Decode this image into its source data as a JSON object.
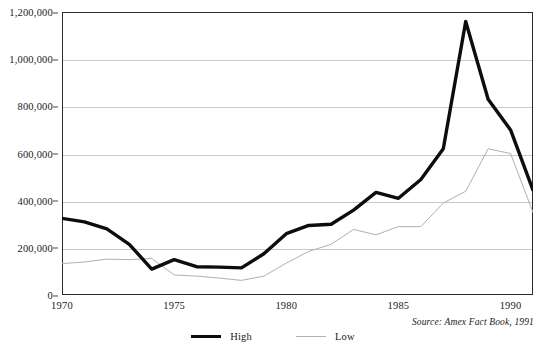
{
  "chart_data": {
    "type": "line",
    "title": "",
    "subtitle": "",
    "xlabel": "",
    "ylabel": "",
    "xlim": [
      1970,
      1991
    ],
    "ylim": [
      0,
      1200000
    ],
    "grid": true,
    "grid_axis": "y",
    "legend_position": "bottom-center",
    "source": "Source: Amex Fact Book, 1991",
    "x": [
      1970,
      1971,
      1972,
      1973,
      1974,
      1975,
      1976,
      1977,
      1978,
      1979,
      1980,
      1981,
      1982,
      1983,
      1984,
      1985,
      1986,
      1987,
      1988,
      1989,
      1990,
      1991
    ],
    "y_tick_labels": [
      "0",
      "200,000",
      "400,000",
      "600,000",
      "800,000",
      "1,000,000",
      "1,200,000"
    ],
    "y_tick_values": [
      0,
      200000,
      400000,
      600000,
      800000,
      1000000,
      1200000
    ],
    "x_tick_labels": [
      "1970",
      "1975",
      "1980",
      "1985",
      "1990"
    ],
    "x_tick_values": [
      1970,
      1975,
      1980,
      1985,
      1990
    ],
    "series": [
      {
        "name": "High",
        "color": "#0d0d0d",
        "width": 3.4,
        "values": [
          325000,
          310000,
          280000,
          215000,
          110000,
          150000,
          120000,
          118000,
          115000,
          175000,
          260000,
          295000,
          300000,
          360000,
          435000,
          410000,
          490000,
          620000,
          1160000,
          830000,
          700000,
          445000
        ]
      },
      {
        "name": "Low",
        "color": "#b0b0b0",
        "width": 1,
        "values": [
          133000,
          140000,
          152000,
          150000,
          155000,
          85000,
          80000,
          72000,
          62000,
          80000,
          135000,
          185000,
          215000,
          278000,
          255000,
          290000,
          290000,
          390000,
          440000,
          620000,
          600000,
          350000
        ]
      }
    ],
    "series_aux": {
      "high_extra": [],
      "low_extra": []
    }
  },
  "axis": {
    "y_ticks": [
      {
        "label": "1,200,000",
        "value": 1200000
      },
      {
        "label": "1,000,000",
        "value": 1000000
      },
      {
        "label": "800,000",
        "value": 800000
      },
      {
        "label": "600,000",
        "value": 600000
      },
      {
        "label": "400,000",
        "value": 400000
      },
      {
        "label": "200,000",
        "value": 200000
      },
      {
        "label": "0",
        "value": 0
      }
    ],
    "x_ticks": [
      {
        "label": "1970",
        "value": 1970
      },
      {
        "label": "1975",
        "value": 1975
      },
      {
        "label": "1980",
        "value": 1980
      },
      {
        "label": "1985",
        "value": 1985
      },
      {
        "label": "1990",
        "value": 1990
      }
    ]
  },
  "legend": {
    "items": [
      {
        "label": "High",
        "color": "#0d0d0d"
      },
      {
        "label": "Low",
        "color": "#b0b0b0"
      }
    ]
  },
  "footer": {
    "source": "Source: Amex Fact Book, 1991"
  },
  "colors": {
    "high": "#0d0d0d",
    "low": "#b0b0b0",
    "grid": "#c9c9c9",
    "frame": "#2b2b2b",
    "text": "#1a1a1a",
    "background": "#ffffff"
  }
}
